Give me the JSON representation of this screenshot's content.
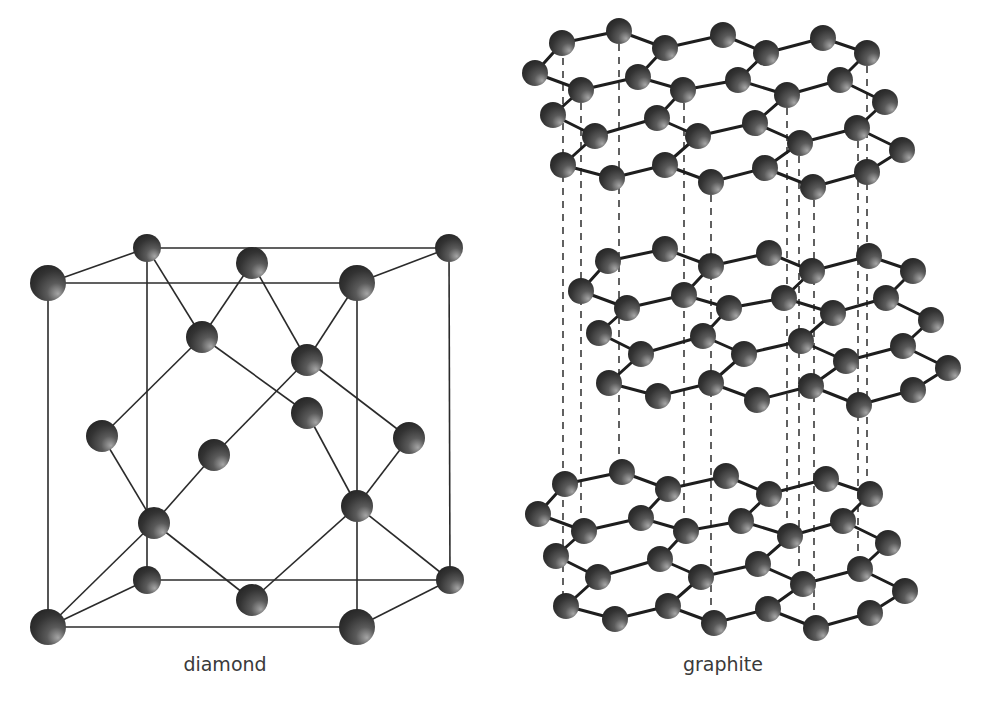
{
  "figure": {
    "panels": [
      {
        "id": "diamond",
        "label": "diamond"
      },
      {
        "id": "graphite",
        "label": "graphite"
      }
    ]
  },
  "colors": {
    "atom_dark": "#2a2a2a",
    "atom_mid": "#4a4a4a",
    "atom_light": "#9a9a9a",
    "bond": "#2b2b2b",
    "dash": "#3a3a3a",
    "caption": "#3a3a3a"
  },
  "diamond": {
    "label": "diamond",
    "atoms": [
      {
        "id": "A",
        "x": 48,
        "y": 283,
        "r": 18
      },
      {
        "id": "B",
        "x": 147,
        "y": 248,
        "r": 14
      },
      {
        "id": "C",
        "x": 252,
        "y": 263,
        "r": 16
      },
      {
        "id": "D",
        "x": 357,
        "y": 283,
        "r": 18
      },
      {
        "id": "E",
        "x": 449,
        "y": 248,
        "r": 14
      },
      {
        "id": "F",
        "x": 202,
        "y": 337,
        "r": 16
      },
      {
        "id": "G",
        "x": 307,
        "y": 360,
        "r": 16
      },
      {
        "id": "H",
        "x": 307,
        "y": 413,
        "r": 16
      },
      {
        "id": "I",
        "x": 102,
        "y": 436,
        "r": 16
      },
      {
        "id": "J",
        "x": 214,
        "y": 455,
        "r": 16
      },
      {
        "id": "K",
        "x": 409,
        "y": 438,
        "r": 16
      },
      {
        "id": "L",
        "x": 154,
        "y": 523,
        "r": 16
      },
      {
        "id": "M",
        "x": 357,
        "y": 506,
        "r": 16
      },
      {
        "id": "N",
        "x": 147,
        "y": 580,
        "r": 14
      },
      {
        "id": "O",
        "x": 252,
        "y": 600,
        "r": 16
      },
      {
        "id": "P",
        "x": 450,
        "y": 580,
        "r": 14
      },
      {
        "id": "Q",
        "x": 48,
        "y": 627,
        "r": 18
      },
      {
        "id": "R",
        "x": 357,
        "y": 627,
        "r": 18
      }
    ],
    "edges": [
      [
        "A",
        "D"
      ],
      [
        "A",
        "Q"
      ],
      [
        "D",
        "R"
      ],
      [
        "Q",
        "R"
      ],
      [
        "B",
        "E"
      ],
      [
        "B",
        "N"
      ],
      [
        "E",
        "P"
      ],
      [
        "N",
        "P"
      ],
      [
        "A",
        "B"
      ],
      [
        "D",
        "E"
      ],
      [
        "Q",
        "N"
      ],
      [
        "R",
        "P"
      ],
      [
        "B",
        "F"
      ],
      [
        "C",
        "F"
      ],
      [
        "C",
        "G"
      ],
      [
        "D",
        "G"
      ],
      [
        "F",
        "I"
      ],
      [
        "F",
        "H"
      ],
      [
        "G",
        "K"
      ],
      [
        "G",
        "J"
      ],
      [
        "H",
        "M"
      ],
      [
        "K",
        "M"
      ],
      [
        "I",
        "L"
      ],
      [
        "J",
        "L"
      ],
      [
        "L",
        "Q"
      ],
      [
        "L",
        "O"
      ],
      [
        "M",
        "O"
      ],
      [
        "M",
        "P"
      ]
    ]
  },
  "graphite": {
    "label": "graphite",
    "atom_r": 13,
    "layer_atoms": [
      {
        "id": "a1",
        "x": 562,
        "y": 43
      },
      {
        "id": "a2",
        "x": 619,
        "y": 31
      },
      {
        "id": "a3",
        "x": 665,
        "y": 48
      },
      {
        "id": "a4",
        "x": 723,
        "y": 35
      },
      {
        "id": "a5",
        "x": 766,
        "y": 53
      },
      {
        "id": "a6",
        "x": 823,
        "y": 38
      },
      {
        "id": "a7",
        "x": 867,
        "y": 53
      },
      {
        "id": "b1",
        "x": 535,
        "y": 73
      },
      {
        "id": "b2",
        "x": 581,
        "y": 90
      },
      {
        "id": "b3",
        "x": 638,
        "y": 77
      },
      {
        "id": "b4",
        "x": 683,
        "y": 90
      },
      {
        "id": "b5",
        "x": 738,
        "y": 80
      },
      {
        "id": "b6",
        "x": 787,
        "y": 95
      },
      {
        "id": "b7",
        "x": 840,
        "y": 80
      },
      {
        "id": "b8",
        "x": 885,
        "y": 102
      },
      {
        "id": "c1",
        "x": 553,
        "y": 115
      },
      {
        "id": "c2",
        "x": 595,
        "y": 136
      },
      {
        "id": "c3",
        "x": 657,
        "y": 118
      },
      {
        "id": "c4",
        "x": 698,
        "y": 136
      },
      {
        "id": "c5",
        "x": 755,
        "y": 123
      },
      {
        "id": "c6",
        "x": 800,
        "y": 143
      },
      {
        "id": "c7",
        "x": 857,
        "y": 128
      },
      {
        "id": "c8",
        "x": 902,
        "y": 150
      },
      {
        "id": "d1",
        "x": 563,
        "y": 165
      },
      {
        "id": "d2",
        "x": 612,
        "y": 178
      },
      {
        "id": "d3",
        "x": 665,
        "y": 165
      },
      {
        "id": "d4",
        "x": 711,
        "y": 182
      },
      {
        "id": "d5",
        "x": 765,
        "y": 168
      },
      {
        "id": "d6",
        "x": 813,
        "y": 187
      },
      {
        "id": "d7",
        "x": 867,
        "y": 172
      }
    ],
    "layer_edges": [
      [
        "a1",
        "a2"
      ],
      [
        "a2",
        "a3"
      ],
      [
        "a3",
        "a4"
      ],
      [
        "a4",
        "a5"
      ],
      [
        "a5",
        "a6"
      ],
      [
        "a6",
        "a7"
      ],
      [
        "a1",
        "b1"
      ],
      [
        "b1",
        "b2"
      ],
      [
        "b2",
        "b3"
      ],
      [
        "b3",
        "a3"
      ],
      [
        "b3",
        "b4"
      ],
      [
        "b4",
        "b5"
      ],
      [
        "b5",
        "a5"
      ],
      [
        "b5",
        "b6"
      ],
      [
        "b6",
        "b7"
      ],
      [
        "b7",
        "a7"
      ],
      [
        "b7",
        "b8"
      ],
      [
        "b2",
        "c1"
      ],
      [
        "c1",
        "c2"
      ],
      [
        "c2",
        "c3"
      ],
      [
        "c3",
        "b4"
      ],
      [
        "c3",
        "c4"
      ],
      [
        "c4",
        "c5"
      ],
      [
        "c5",
        "b6"
      ],
      [
        "c5",
        "c6"
      ],
      [
        "c6",
        "c7"
      ],
      [
        "c7",
        "b8"
      ],
      [
        "c7",
        "c8"
      ],
      [
        "c2",
        "d1"
      ],
      [
        "d1",
        "d2"
      ],
      [
        "d2",
        "d3"
      ],
      [
        "d3",
        "c4"
      ],
      [
        "d3",
        "d4"
      ],
      [
        "d4",
        "d5"
      ],
      [
        "d5",
        "c6"
      ],
      [
        "d5",
        "d6"
      ],
      [
        "d6",
        "d7"
      ],
      [
        "d7",
        "c8"
      ]
    ],
    "layers": [
      {
        "name": "top-layer",
        "dx": 0,
        "dy": 0
      },
      {
        "name": "middle-layer",
        "dx": 46,
        "dy": 218
      },
      {
        "name": "bottom-layer",
        "dx": 3,
        "dy": 441
      }
    ],
    "dashed_lines": [
      {
        "x": 563,
        "y1": 45,
        "y2": 606
      },
      {
        "x": 581,
        "y1": 90,
        "y2": 532
      },
      {
        "x": 619,
        "y1": 31,
        "y2": 473
      },
      {
        "x": 684,
        "y1": 90,
        "y2": 531
      },
      {
        "x": 711,
        "y1": 182,
        "y2": 623
      },
      {
        "x": 787,
        "y1": 95,
        "y2": 536
      },
      {
        "x": 799,
        "y1": 143,
        "y2": 584
      },
      {
        "x": 814,
        "y1": 187,
        "y2": 628
      },
      {
        "x": 858,
        "y1": 128,
        "y2": 569
      },
      {
        "x": 867,
        "y1": 53,
        "y2": 494
      }
    ]
  }
}
